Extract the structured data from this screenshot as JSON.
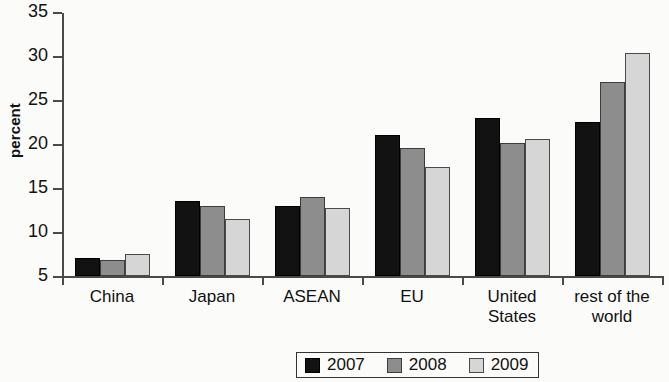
{
  "chart_data": {
    "type": "bar",
    "title": "",
    "subtitle": "",
    "xlabel": "",
    "ylabel": "percent",
    "ylim": [
      5,
      35
    ],
    "yticks": [
      5,
      10,
      15,
      20,
      25,
      30,
      35
    ],
    "grid": false,
    "legend_position": "bottom-center",
    "categories": [
      "China",
      "Japan",
      "ASEAN",
      "EU",
      "United States",
      "rest of the world"
    ],
    "category_lines": [
      [
        "China"
      ],
      [
        "Japan"
      ],
      [
        "ASEAN"
      ],
      [
        "EU"
      ],
      [
        "United",
        "States"
      ],
      [
        "rest of the",
        "world"
      ]
    ],
    "series": [
      {
        "name": "2007",
        "color": "#121212",
        "values": [
          7.0,
          13.5,
          12.9,
          21.0,
          23.0,
          22.5
        ]
      },
      {
        "name": "2008",
        "color": "#8d8d8d",
        "values": [
          6.8,
          12.9,
          14.0,
          19.5,
          20.1,
          27.0
        ]
      },
      {
        "name": "2009",
        "color": "#d6d6d6",
        "values": [
          7.5,
          11.5,
          12.7,
          17.4,
          20.6,
          30.3
        ]
      }
    ]
  },
  "axis": {
    "y_title": "percent",
    "tick_labels": [
      "5",
      "10",
      "15",
      "20",
      "25",
      "30",
      "35"
    ]
  },
  "legend": {
    "entries": [
      {
        "label": "2007",
        "swatch": "black-square-swatch"
      },
      {
        "label": "2008",
        "swatch": "gray-square-swatch"
      },
      {
        "label": "2009",
        "swatch": "light-gray-square-swatch"
      }
    ]
  }
}
